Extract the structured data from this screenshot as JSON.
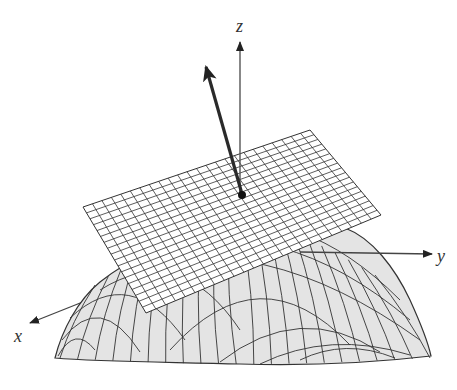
{
  "figure": {
    "axes": {
      "x_label": "x",
      "y_label": "y",
      "z_label": "z"
    },
    "elements": {
      "surface": "curved surface (downward-opening dome) with wireframe mesh",
      "tangent_plane": "rectangular gridded plane tangent at a point",
      "normal_vector": "arrow normal to the tangent plane",
      "point_of_tangency": "filled dot"
    },
    "colors": {
      "surface_fill": "#e4e4e4",
      "mesh_line": "#333333",
      "plane_fill": "#ffffff",
      "axis": "#444444",
      "normal_arrow": "#2a2a2a"
    },
    "plane_grid": {
      "rows": 18,
      "cols": 24
    }
  }
}
